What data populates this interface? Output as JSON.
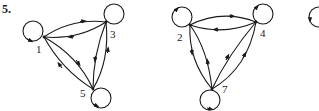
{
  "problem": {
    "number": "5."
  },
  "graphs": [
    {
      "id": "left",
      "nodes": [
        {
          "label": "1",
          "x": 44,
          "y": 37
        },
        {
          "label": "3",
          "x": 106,
          "y": 22
        },
        {
          "label": "5",
          "x": 93,
          "y": 89
        }
      ],
      "edges": [
        {
          "from": "1",
          "to": "3"
        },
        {
          "from": "3",
          "to": "1"
        },
        {
          "from": "1",
          "to": "5"
        },
        {
          "from": "5",
          "to": "1"
        },
        {
          "from": "3",
          "to": "5"
        },
        {
          "from": "5",
          "to": "3"
        }
      ],
      "self_loops": [
        "1",
        "3",
        "5"
      ]
    },
    {
      "id": "middle",
      "nodes": [
        {
          "label": "2",
          "x": 50,
          "y": 25
        },
        {
          "label": "4",
          "x": 116,
          "y": 22
        },
        {
          "label": "7",
          "x": 72,
          "y": 89
        }
      ],
      "edges": [
        {
          "from": "2",
          "to": "4"
        },
        {
          "from": "4",
          "to": "2"
        },
        {
          "from": "2",
          "to": "7"
        },
        {
          "from": "7",
          "to": "2"
        },
        {
          "from": "7",
          "to": "4"
        },
        {
          "from": "7",
          "to": "4"
        }
      ],
      "self_loops": [
        "2",
        "4",
        "7"
      ]
    },
    {
      "id": "right-partial",
      "self_loops": [
        "partial"
      ]
    }
  ],
  "colors": {
    "ink": "#1a1a1a",
    "background": "#ffffff"
  }
}
